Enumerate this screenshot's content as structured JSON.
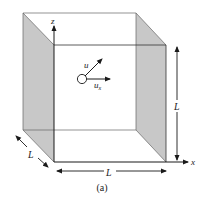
{
  "figure": {
    "caption": "(a)",
    "axes": {
      "z_label": "z",
      "x_label": "x"
    },
    "particle": {
      "velocity_label": "u",
      "component_label_main": "u",
      "component_label_sub": "x"
    },
    "dimensions": {
      "height_label": "L",
      "width_label": "L",
      "depth_label": "L"
    },
    "colors": {
      "shaded_wall": "#c8c8c8",
      "line": "#1a1a1a",
      "thin_line": "#555555",
      "background": "#ffffff"
    }
  }
}
